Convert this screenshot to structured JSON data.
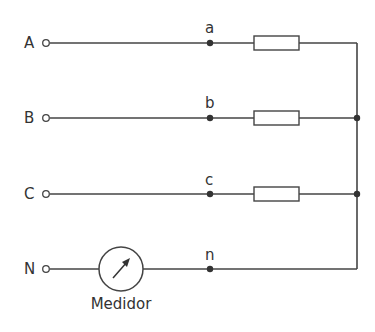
{
  "diagram": {
    "type": "three-phase wye load circuit with neutral meter",
    "colors": {
      "line": "#444444",
      "text": "#333333",
      "background": "#ffffff"
    },
    "phases": [
      {
        "terminal_label": "A",
        "node_label": "a",
        "y": 43,
        "has_resistor": true
      },
      {
        "terminal_label": "B",
        "node_label": "b",
        "y": 118,
        "has_resistor": true
      },
      {
        "terminal_label": "C",
        "node_label": "c",
        "y": 194,
        "has_resistor": true
      }
    ],
    "neutral": {
      "terminal_label": "N",
      "node_label": "n",
      "y": 269,
      "meter_label": "Medidor"
    }
  }
}
